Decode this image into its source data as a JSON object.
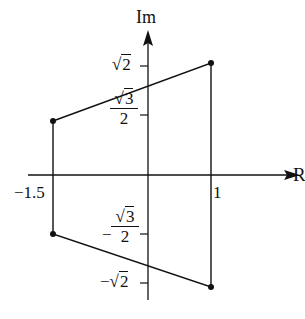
{
  "figure": {
    "type": "complex-plane-diagram",
    "axes": {
      "x_label": "R",
      "y_label": "Im"
    },
    "x_ticks": [
      {
        "label": "−1.5",
        "value": -1.5
      },
      {
        "label": "1",
        "value": 1
      }
    ],
    "y_ticks": [
      {
        "label_prefix": "√",
        "label_radicand": "2",
        "value": 1.4142,
        "sign": ""
      },
      {
        "frac_num_prefix": "√",
        "frac_num_radicand": "3",
        "frac_den": "2",
        "value": 0.866,
        "sign": ""
      },
      {
        "frac_num_prefix": "√",
        "frac_num_radicand": "3",
        "frac_den": "2",
        "value": -0.866,
        "sign": "−"
      },
      {
        "label_prefix": "√",
        "label_radicand": "2",
        "value": -1.4142,
        "sign": "−"
      }
    ],
    "vertices": [
      {
        "x": -1.5,
        "y": 0.866
      },
      {
        "x": 1,
        "y": 1.4142
      },
      {
        "x": 1,
        "y": -1.4142
      },
      {
        "x": -1.5,
        "y": -0.866
      }
    ],
    "colors": {
      "stroke": "#111111",
      "background": "#ffffff"
    }
  }
}
